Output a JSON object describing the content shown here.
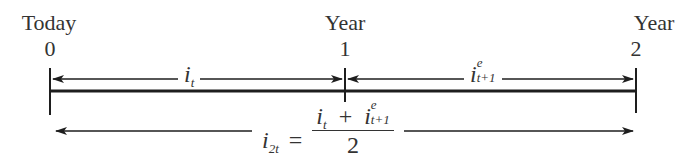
{
  "diagram": {
    "type": "timeline",
    "colors": {
      "line": "#1e1e1e",
      "text": "#333333",
      "background": "#ffffff"
    },
    "points": [
      {
        "caption": "Today",
        "value": "0"
      },
      {
        "caption": "Year",
        "value": "1"
      },
      {
        "caption": "Year",
        "value": "2"
      }
    ],
    "segments": [
      {
        "from": "0",
        "to": "1",
        "label_base": "i",
        "label_sub": "t",
        "label_sup": ""
      },
      {
        "from": "1",
        "to": "2",
        "label_base": "i",
        "label_sub": "t+1",
        "label_sup": "e"
      }
    ],
    "span": {
      "from": "0",
      "to": "2",
      "lhs_base": "i",
      "lhs_sub": "2t",
      "equals": "=",
      "numerator": {
        "term1_base": "i",
        "term1_sub": "t",
        "plus": "+",
        "term2_base": "i",
        "term2_sub": "t+1",
        "term2_sup": "e"
      },
      "denominator": "2"
    }
  }
}
